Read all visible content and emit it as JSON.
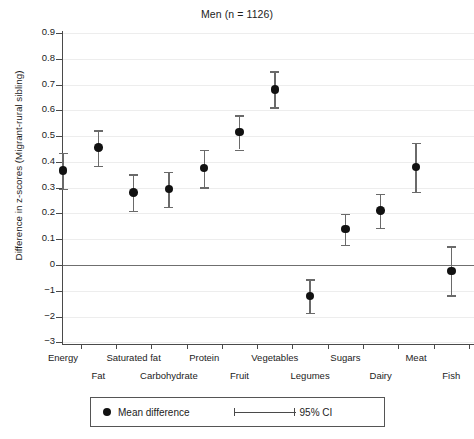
{
  "chart_data": {
    "type": "scatter",
    "title": "Men (n = 1126)",
    "xlabel": "",
    "ylabel": "Difference in z-scores (Migrant-rural sibling)",
    "ylim": [
      -0.3,
      0.95
    ],
    "grid": true,
    "legend_position": "bottom-center",
    "y_tick_labels": [
      "0.9",
      "0.8",
      "0.7",
      "0.6",
      "0.5",
      "0.4",
      "0.3",
      "0.2",
      "0.1",
      "0",
      "−1",
      "−2",
      "−3"
    ],
    "y_tick_values": [
      0.9,
      0.8,
      0.7,
      0.6,
      0.5,
      0.4,
      0.3,
      0.2,
      0.1,
      0,
      -0.1,
      -0.2,
      -0.3
    ],
    "categories": [
      "Energy",
      "Fat",
      "Saturated fat",
      "Carbohydrate",
      "Protein",
      "Fruit",
      "Vegetables",
      "Legumes",
      "Sugars",
      "Dairy",
      "Meat",
      "Fish"
    ],
    "series": [
      {
        "name": "Mean difference",
        "values": [
          0.366,
          0.455,
          0.281,
          0.294,
          0.376,
          0.515,
          0.681,
          -0.121,
          0.139,
          0.211,
          0.381,
          -0.024
        ],
        "ci_low": [
          0.296,
          0.385,
          0.211,
          0.225,
          0.301,
          0.448,
          0.612,
          -0.185,
          0.079,
          0.145,
          0.284,
          -0.118
        ],
        "ci_high": [
          0.436,
          0.522,
          0.352,
          0.362,
          0.447,
          0.581,
          0.751,
          -0.056,
          0.199,
          0.275,
          0.475,
          0.072
        ]
      }
    ],
    "legend": [
      {
        "label": "Mean difference",
        "glyph": "filled-circle"
      },
      {
        "label": "95% CI",
        "glyph": "error-bar"
      }
    ],
    "colors": {
      "marker": "#111111",
      "ci": "#6a6a6a",
      "axis": "#4a4a4a",
      "grid": "#ededed",
      "zero_line": "#6f6f6f"
    }
  }
}
